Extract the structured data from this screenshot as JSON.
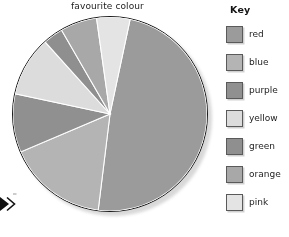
{
  "chart_data": {
    "type": "pie",
    "title": "favourite colour",
    "xlabel": "",
    "ylabel": "",
    "legend_position": "right",
    "legend_title": "Key",
    "grid": false,
    "start_angle_deg": 12,
    "direction": "clockwise",
    "categories": [
      "red",
      "blue",
      "purple",
      "yellow",
      "green",
      "orange",
      "pink"
    ],
    "values": [
      48.5,
      16.5,
      10,
      10,
      3.5,
      6,
      5.5
    ],
    "units": "percent",
    "slices": [
      {
        "label": "red",
        "percent": 48.5,
        "angle_deg": 175,
        "start_deg": 12,
        "end_deg": 187,
        "color": "#9b9b9b"
      },
      {
        "label": "blue",
        "percent": 16.5,
        "angle_deg": 60,
        "start_deg": 187,
        "end_deg": 247,
        "color": "#b4b4b4"
      },
      {
        "label": "purple",
        "percent": 10,
        "angle_deg": 35,
        "start_deg": 247,
        "end_deg": 282,
        "color": "#909090"
      },
      {
        "label": "yellow",
        "percent": 10,
        "angle_deg": 36,
        "start_deg": 282,
        "end_deg": 318,
        "color": "#dcdcdc"
      },
      {
        "label": "green",
        "percent": 3.5,
        "angle_deg": 12,
        "start_deg": 318,
        "end_deg": 330,
        "color": "#8f8f8f"
      },
      {
        "label": "orange",
        "percent": 6,
        "angle_deg": 22,
        "start_deg": 330,
        "end_deg": 352,
        "color": "#a8a8a8"
      },
      {
        "label": "pink",
        "percent": 5.5,
        "angle_deg": 20,
        "start_deg": 352,
        "end_deg": 372,
        "color": "#e4e4e4"
      }
    ]
  },
  "title": {
    "text": "favourite colour"
  },
  "legend": {
    "title": "Key",
    "items": [
      {
        "label": "red",
        "color": "#9b9b9b"
      },
      {
        "label": "blue",
        "color": "#b4b4b4"
      },
      {
        "label": "purple",
        "color": "#909090"
      },
      {
        "label": "yellow",
        "color": "#dcdcdc"
      },
      {
        "label": "green",
        "color": "#8f8f8f"
      },
      {
        "label": "orange",
        "color": "#a8a8a8"
      },
      {
        "label": "pink",
        "color": "#e4e4e4"
      }
    ]
  },
  "annotations": {
    "edge_marker": "double-chevron-right"
  },
  "colors": {
    "outline": "#1a1a1a",
    "text": "#1d1d1d",
    "background": "#ffffff"
  }
}
